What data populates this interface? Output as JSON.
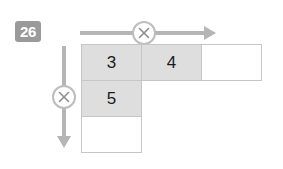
{
  "problem": {
    "number": "26",
    "type": "multiplication-area-grid"
  },
  "operators": {
    "horizontal": {
      "symbol": "×",
      "icon": "multiply-circle-icon",
      "direction": "right",
      "arrow_icon": "arrow-right-icon"
    },
    "vertical": {
      "symbol": "×",
      "icon": "multiply-circle-icon",
      "direction": "down",
      "arrow_icon": "arrow-down-icon"
    }
  },
  "colors": {
    "badge_background": "#9a9a9a",
    "badge_text": "#ffffff",
    "cell_filled": "#dedede",
    "cell_empty": "#ffffff",
    "cell_border": "#c6c6c6",
    "arrow": "#b5b5b5",
    "circle_border": "#bdbdbd",
    "number_text": "#1b1b1b"
  },
  "grid": {
    "rows": 3,
    "cols": 3,
    "cells": [
      [
        {
          "value": "3",
          "state": "filled"
        },
        {
          "value": "4",
          "state": "filled"
        },
        {
          "value": "",
          "state": "empty"
        }
      ],
      [
        {
          "value": "5",
          "state": "filled"
        },
        {
          "value": "",
          "state": "blank"
        },
        {
          "value": "",
          "state": "blank"
        }
      ],
      [
        {
          "value": "",
          "state": "empty"
        },
        {
          "value": "",
          "state": "blank"
        },
        {
          "value": "",
          "state": "blank"
        }
      ]
    ]
  }
}
